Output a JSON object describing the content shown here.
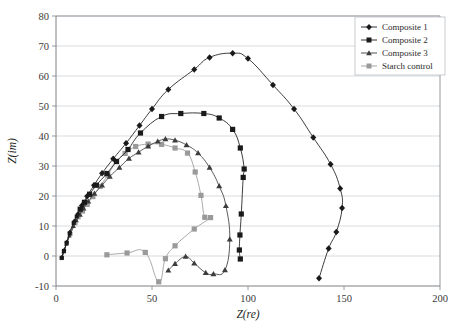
{
  "chart_data": {
    "type": "scatter",
    "title": "",
    "xlabel": "Z(re)",
    "ylabel": "Z(im)",
    "xlim": [
      0,
      200
    ],
    "ylim": [
      -10,
      80
    ],
    "xticks": [
      0,
      50,
      100,
      150,
      200
    ],
    "yticks": [
      -10,
      0,
      10,
      20,
      30,
      40,
      50,
      60,
      70,
      80
    ],
    "grid": "horizontal",
    "legend_position": "top-right",
    "series": [
      {
        "name": "Composite 1",
        "marker": "diamond",
        "color": "#1a1a1a",
        "points": [
          [
            3.0,
            -0.5
          ],
          [
            3.6,
            0.6
          ],
          [
            4.2,
            1.8
          ],
          [
            4.9,
            3.1
          ],
          [
            5.6,
            4.6
          ],
          [
            6.4,
            6.2
          ],
          [
            7.2,
            7.9
          ],
          [
            8.2,
            9.6
          ],
          [
            9.6,
            11.7
          ],
          [
            11.3,
            14.0
          ],
          [
            13.5,
            16.8
          ],
          [
            16.2,
            19.9
          ],
          [
            19.8,
            23.6
          ],
          [
            24.0,
            27.6
          ],
          [
            29.8,
            32.4
          ],
          [
            36.5,
            37.6
          ],
          [
            43.5,
            43.5
          ],
          [
            50.0,
            49.0
          ],
          [
            58.5,
            55.5
          ],
          [
            72.0,
            62.2
          ],
          [
            80.0,
            66.2
          ],
          [
            92.0,
            67.6
          ],
          [
            100.0,
            65.8
          ],
          [
            113.0,
            57.0
          ],
          [
            124.0,
            49.0
          ],
          [
            134.0,
            39.5
          ],
          [
            143.0,
            30.6
          ],
          [
            148.0,
            22.5
          ],
          [
            149.0,
            16.0
          ],
          [
            146.0,
            8.0
          ],
          [
            142.0,
            2.5
          ],
          [
            137.0,
            -7.4
          ]
        ]
      },
      {
        "name": "Composite 2",
        "marker": "square",
        "color": "#1a1a1a",
        "points": [
          [
            3.0,
            -0.6
          ],
          [
            3.5,
            0.5
          ],
          [
            4.1,
            1.7
          ],
          [
            4.8,
            3.0
          ],
          [
            5.5,
            4.4
          ],
          [
            6.3,
            5.9
          ],
          [
            7.1,
            7.5
          ],
          [
            8.0,
            9.1
          ],
          [
            9.2,
            11.0
          ],
          [
            10.8,
            13.2
          ],
          [
            12.6,
            15.6
          ],
          [
            14.8,
            17.9
          ],
          [
            17.5,
            20.6
          ],
          [
            21.0,
            23.6
          ],
          [
            26.5,
            27.5
          ],
          [
            31.5,
            31.5
          ],
          [
            37.5,
            35.5
          ],
          [
            44.0,
            41.0
          ],
          [
            55.0,
            46.5
          ],
          [
            65.0,
            47.5
          ],
          [
            77.0,
            47.5
          ],
          [
            85.0,
            46.0
          ],
          [
            92.0,
            42.2
          ],
          [
            96.0,
            36.0
          ],
          [
            98.0,
            29.0
          ],
          [
            97.5,
            26.2
          ],
          [
            96.5,
            14.0
          ],
          [
            95.8,
            7.0
          ],
          [
            95.5,
            2.0
          ],
          [
            96.0,
            -1.0
          ]
        ]
      },
      {
        "name": "Composite 3",
        "marker": "triangle",
        "color": "#3c3c3c",
        "points": [
          [
            3.0,
            -0.7
          ],
          [
            3.5,
            0.4
          ],
          [
            4.0,
            1.5
          ],
          [
            4.7,
            2.7
          ],
          [
            5.4,
            4.0
          ],
          [
            6.2,
            5.3
          ],
          [
            7.0,
            6.7
          ],
          [
            8.0,
            8.2
          ],
          [
            9.2,
            9.9
          ],
          [
            10.7,
            11.8
          ],
          [
            12.4,
            13.8
          ],
          [
            14.3,
            15.9
          ],
          [
            16.8,
            18.2
          ],
          [
            20.0,
            20.8
          ],
          [
            24.0,
            23.6
          ],
          [
            28.0,
            26.5
          ],
          [
            33.0,
            29.5
          ],
          [
            38.0,
            32.5
          ],
          [
            43.0,
            34.6
          ],
          [
            48.0,
            36.6
          ],
          [
            53.0,
            38.2
          ],
          [
            57.0,
            39.0
          ],
          [
            62.0,
            38.6
          ],
          [
            68.0,
            37.0
          ],
          [
            74.0,
            34.3
          ],
          [
            80.0,
            29.5
          ],
          [
            85.0,
            23.3
          ],
          [
            88.5,
            16.7
          ],
          [
            90.5,
            5.6
          ],
          [
            88.0,
            -4.7
          ],
          [
            82.0,
            -6.0
          ],
          [
            78.0,
            -5.6
          ],
          [
            72.0,
            -2.4
          ],
          [
            67.5,
            -0.2
          ],
          [
            62.0,
            -2.6
          ],
          [
            58.5,
            -4.8
          ]
        ]
      },
      {
        "name": "Starch control",
        "marker": "square",
        "color": "#9a9a9a",
        "points": [
          [
            3.0,
            -0.7
          ],
          [
            3.6,
            0.4
          ],
          [
            4.2,
            1.6
          ],
          [
            4.9,
            2.9
          ],
          [
            5.7,
            4.3
          ],
          [
            6.6,
            5.8
          ],
          [
            7.6,
            7.4
          ],
          [
            8.8,
            9.1
          ],
          [
            10.2,
            10.9
          ],
          [
            11.8,
            12.9
          ],
          [
            13.8,
            15.0
          ],
          [
            16.2,
            17.2
          ],
          [
            19.2,
            19.8
          ],
          [
            23.0,
            23.2
          ],
          [
            27.0,
            27.0
          ],
          [
            31.5,
            31.5
          ],
          [
            36.0,
            34.2
          ],
          [
            41.5,
            36.5
          ],
          [
            48.0,
            37.3
          ],
          [
            55.0,
            37.2
          ],
          [
            62.0,
            36.0
          ],
          [
            68.5,
            34.3
          ],
          [
            72.5,
            28.0
          ],
          [
            75.5,
            20.2
          ],
          [
            77.5,
            12.9
          ],
          [
            80.5,
            12.8
          ],
          [
            72.0,
            9.0
          ],
          [
            62.0,
            3.4
          ],
          [
            57.0,
            -0.9
          ],
          [
            53.5,
            -8.6
          ],
          [
            46.5,
            1.2
          ],
          [
            37.0,
            1.0
          ],
          [
            26.5,
            0.4
          ]
        ]
      }
    ]
  },
  "legend": {
    "entries": [
      {
        "label": "Composite 1"
      },
      {
        "label": "Composite 2"
      },
      {
        "label": "Composite 3"
      },
      {
        "label": "Starch control"
      }
    ]
  },
  "axes": {
    "x": {
      "title": "Z(re)",
      "tick_labels": [
        "0",
        "50",
        "100",
        "150",
        "200"
      ]
    },
    "y": {
      "title": "Z(im)",
      "tick_labels": [
        "-10",
        "0",
        "10",
        "20",
        "30",
        "40",
        "50",
        "60",
        "70",
        "80"
      ]
    }
  },
  "colors": {
    "series_dark": "#1a1a1a",
    "series_mid": "#3c3c3c",
    "series_gray": "#9a9a9a",
    "grid": "#c8ccd0",
    "frame": "#8a8f94"
  }
}
